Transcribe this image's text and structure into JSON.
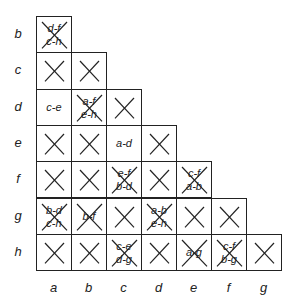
{
  "row_states": [
    "b",
    "c",
    "d",
    "e",
    "f",
    "g",
    "h"
  ],
  "col_states": [
    "a",
    "b",
    "c",
    "d",
    "e",
    "f",
    "g"
  ],
  "cells": [
    {
      "row": "b",
      "col": "a",
      "crossed": true,
      "implied": [
        "d-f",
        "c-h"
      ]
    },
    {
      "row": "c",
      "col": "a",
      "crossed": true,
      "implied": []
    },
    {
      "row": "c",
      "col": "b",
      "crossed": true,
      "implied": []
    },
    {
      "row": "d",
      "col": "a",
      "crossed": false,
      "implied": [
        "c-e"
      ]
    },
    {
      "row": "d",
      "col": "b",
      "crossed": true,
      "implied": [
        "a-f",
        "e-h"
      ]
    },
    {
      "row": "d",
      "col": "c",
      "crossed": true,
      "implied": []
    },
    {
      "row": "e",
      "col": "a",
      "crossed": true,
      "implied": []
    },
    {
      "row": "e",
      "col": "b",
      "crossed": true,
      "implied": []
    },
    {
      "row": "e",
      "col": "c",
      "crossed": false,
      "implied": [
        "a-d"
      ]
    },
    {
      "row": "e",
      "col": "d",
      "crossed": true,
      "implied": []
    },
    {
      "row": "f",
      "col": "a",
      "crossed": true,
      "implied": []
    },
    {
      "row": "f",
      "col": "b",
      "crossed": true,
      "implied": []
    },
    {
      "row": "f",
      "col": "c",
      "crossed": true,
      "implied": [
        "e-f",
        "b-d"
      ]
    },
    {
      "row": "f",
      "col": "d",
      "crossed": true,
      "implied": []
    },
    {
      "row": "f",
      "col": "e",
      "crossed": true,
      "implied": [
        "c-f",
        "a-b"
      ]
    },
    {
      "row": "g",
      "col": "a",
      "crossed": true,
      "implied": [
        "b-d",
        "c-h"
      ]
    },
    {
      "row": "g",
      "col": "b",
      "crossed": true,
      "implied": [
        "b-f"
      ]
    },
    {
      "row": "g",
      "col": "c",
      "crossed": true,
      "implied": []
    },
    {
      "row": "g",
      "col": "d",
      "crossed": true,
      "implied": [
        "a-b",
        "e-h"
      ]
    },
    {
      "row": "g",
      "col": "e",
      "crossed": true,
      "implied": []
    },
    {
      "row": "g",
      "col": "f",
      "crossed": true,
      "implied": []
    },
    {
      "row": "h",
      "col": "a",
      "crossed": true,
      "implied": []
    },
    {
      "row": "h",
      "col": "b",
      "crossed": true,
      "implied": []
    },
    {
      "row": "h",
      "col": "c",
      "crossed": true,
      "implied": [
        "c-e",
        "d-g"
      ]
    },
    {
      "row": "h",
      "col": "d",
      "crossed": true,
      "implied": []
    },
    {
      "row": "h",
      "col": "e",
      "crossed": true,
      "implied": [
        "a-g"
      ]
    },
    {
      "row": "h",
      "col": "f",
      "crossed": true,
      "implied": [
        "c-f",
        "b-g"
      ]
    },
    {
      "row": "h",
      "col": "g",
      "crossed": true,
      "implied": []
    }
  ],
  "colors": {
    "line": "#222222",
    "background": "#ffffff"
  }
}
